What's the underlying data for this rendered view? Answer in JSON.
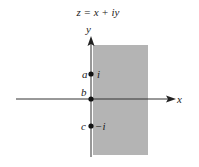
{
  "title": "z = x + iy",
  "axes": {
    "x_label": "x",
    "y_label": "y"
  },
  "region": {
    "description": "Re z > 0 (right half-plane)",
    "fill": "#b4b4b4"
  },
  "points": [
    {
      "name": "a",
      "value": "i"
    },
    {
      "name": "b",
      "value": ""
    },
    {
      "name": "c",
      "value": "−i"
    }
  ]
}
